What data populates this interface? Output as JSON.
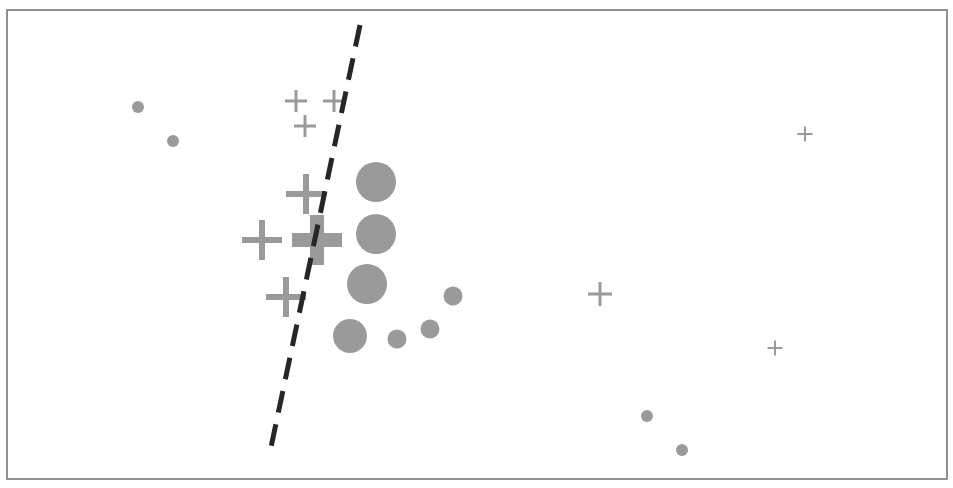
{
  "diagram": {
    "colors": {
      "frame": "#6e6e6e",
      "marker": "#9a9a9a",
      "boundary": "#262626",
      "background": "#ffffff"
    },
    "frame": {
      "x": 7,
      "y": 10,
      "width": 940,
      "height": 469
    },
    "boundary": {
      "x1": 360,
      "y1": 25,
      "x2": 270,
      "y2": 452,
      "style": "dashed"
    },
    "crosses": [
      {
        "x": 296,
        "y": 101,
        "size": 22,
        "stroke": 3
      },
      {
        "x": 334,
        "y": 101,
        "size": 22,
        "stroke": 3
      },
      {
        "x": 305,
        "y": 126,
        "size": 22,
        "stroke": 3
      },
      {
        "x": 306,
        "y": 194,
        "size": 40,
        "stroke": 6
      },
      {
        "x": 262,
        "y": 240,
        "size": 40,
        "stroke": 6
      },
      {
        "x": 317,
        "y": 240,
        "size": 50,
        "stroke": 14
      },
      {
        "x": 286,
        "y": 297,
        "size": 40,
        "stroke": 6
      },
      {
        "x": 600,
        "y": 294,
        "size": 24,
        "stroke": 3
      },
      {
        "x": 805,
        "y": 134,
        "size": 15,
        "stroke": 2
      },
      {
        "x": 775,
        "y": 348,
        "size": 15,
        "stroke": 2
      }
    ],
    "circles": [
      {
        "x": 138,
        "y": 107,
        "r": 6
      },
      {
        "x": 173,
        "y": 141,
        "r": 6
      },
      {
        "x": 376,
        "y": 182,
        "r": 20
      },
      {
        "x": 376,
        "y": 234,
        "r": 20
      },
      {
        "x": 367,
        "y": 284,
        "r": 20
      },
      {
        "x": 453,
        "y": 296,
        "r": 9.5
      },
      {
        "x": 350,
        "y": 336,
        "r": 17
      },
      {
        "x": 397,
        "y": 339,
        "r": 9.5
      },
      {
        "x": 430,
        "y": 329,
        "r": 9.5
      },
      {
        "x": 647,
        "y": 416,
        "r": 6
      },
      {
        "x": 682,
        "y": 450,
        "r": 6
      }
    ]
  }
}
